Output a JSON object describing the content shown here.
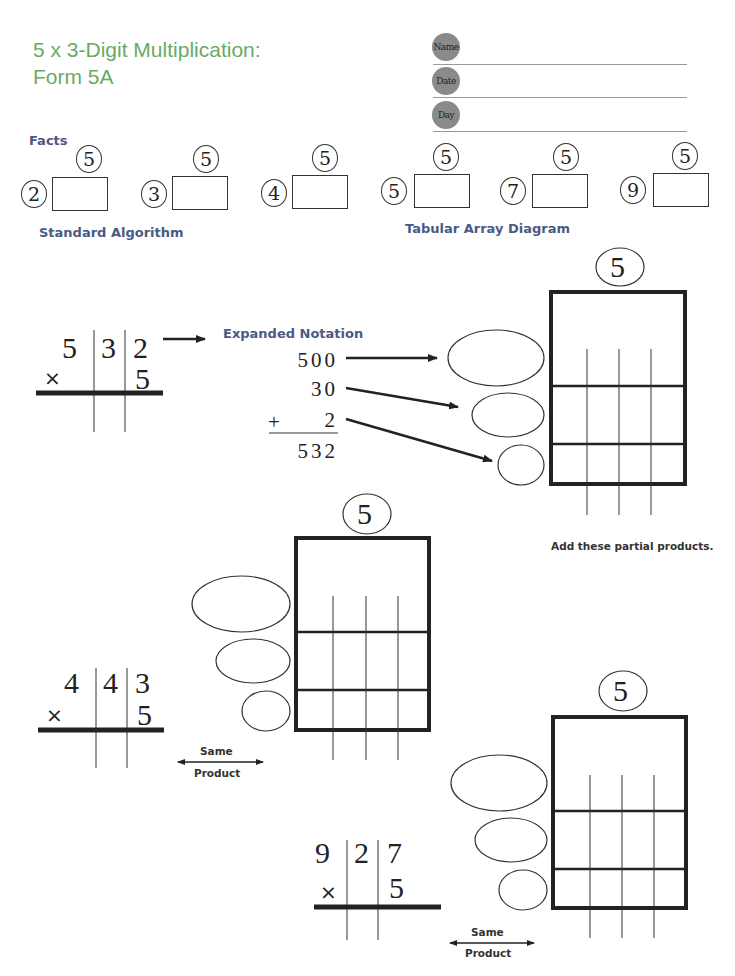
{
  "header": {
    "title_line1": "5 x 3-Digit Multiplication:",
    "title_line2": "Form  5A",
    "fields": [
      {
        "label": "Name",
        "value": ""
      },
      {
        "label": "Date",
        "value": ""
      },
      {
        "label": "Day",
        "value": ""
      }
    ]
  },
  "facts": {
    "heading": "Facts",
    "items": [
      {
        "left": "2",
        "top": "5",
        "answer": ""
      },
      {
        "left": "3",
        "top": "5",
        "answer": ""
      },
      {
        "left": "4",
        "top": "5",
        "answer": ""
      },
      {
        "left": "5",
        "top": "5",
        "answer": ""
      },
      {
        "left": "7",
        "top": "5",
        "answer": ""
      },
      {
        "left": "9",
        "top": "5",
        "answer": ""
      }
    ]
  },
  "sections": {
    "standard_algorithm": "Standard Algorithm",
    "tabular_array": "Tabular Array Diagram",
    "expanded_notation": "Expanded Notation",
    "add_partial": "Add these partial products.",
    "same_product_top": "Same",
    "same_product_bottom": "Product"
  },
  "problems": [
    {
      "digits": [
        "5",
        "3",
        "2"
      ],
      "multiplier": "5",
      "operator": "×",
      "array_factor": "5",
      "expanded": {
        "hundreds": "500",
        "tens": "30",
        "ones": "2",
        "plus": "+",
        "total": "532"
      }
    },
    {
      "digits": [
        "4",
        "4",
        "3"
      ],
      "multiplier": "5",
      "operator": "×",
      "array_factor": "5"
    },
    {
      "digits": [
        "9",
        "2",
        "7"
      ],
      "multiplier": "5",
      "operator": "×",
      "array_factor": "5"
    }
  ]
}
